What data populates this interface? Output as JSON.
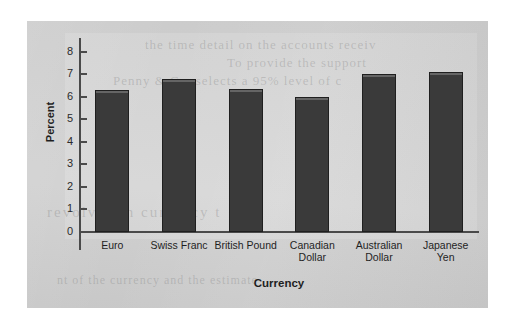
{
  "figure": {
    "background_color": "#ffffff",
    "panel_color": "#cfcfcf",
    "plot_band_color": "#d6d6d6",
    "bar_color": "#3a3a3a",
    "axis_color": "#4a4a4a",
    "text_color": "#1f1f1f"
  },
  "ghost_text": {
    "line1": "the time detail on the accounts receiv",
    "line2": "To provide the support",
    "line3": "Penny & Co. selects a 95% level of c",
    "line4": "revolves in currency t",
    "line5": "nt of the currency and the estimate"
  },
  "chart_data": {
    "type": "bar",
    "title": "",
    "xlabel": "Currency",
    "ylabel": "Percent",
    "categories": [
      "Euro",
      "Swiss Franc",
      "British Pound",
      "Canadian\nDollar",
      "Australian\nDollar",
      "Japanese\nYen"
    ],
    "values": [
      6.3,
      6.8,
      6.35,
      6.0,
      7.0,
      7.1
    ],
    "ylim": [
      0,
      8.6
    ],
    "yticks": [
      0,
      1,
      2,
      3,
      4,
      5,
      6,
      7,
      8
    ],
    "ytick_labels": [
      "0",
      "1",
      "2",
      "3",
      "4",
      "5",
      "6",
      "7",
      "8"
    ],
    "grid": false,
    "legend": false,
    "legend_position": "none",
    "series": [
      {
        "name": "Percent",
        "values": [
          6.3,
          6.8,
          6.35,
          6.0,
          7.0,
          7.1
        ]
      }
    ]
  }
}
